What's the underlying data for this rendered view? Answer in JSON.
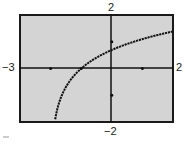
{
  "chart_data": {
    "type": "line",
    "title": "",
    "xlabel": "",
    "ylabel": "",
    "xlim": [
      -3,
      2
    ],
    "ylim": [
      -2,
      2
    ],
    "xtick_labels": {
      "min": "−3",
      "max": "2"
    },
    "ytick_labels": {
      "min": "−2",
      "max": "2"
    },
    "xticks": [
      -2,
      -1,
      1
    ],
    "yticks": [
      -1,
      1
    ],
    "grid": false,
    "legend": null,
    "series": [
      {
        "name": "y = ln(x + 2)",
        "x": [
          -1.85,
          -1.75,
          -1.5,
          -1.25,
          -1,
          -0.5,
          0,
          0.5,
          1,
          1.5,
          2
        ],
        "y": [
          -1.9,
          -1.39,
          -0.69,
          -0.29,
          0,
          0.41,
          0.69,
          0.92,
          1.1,
          1.25,
          1.39
        ]
      }
    ],
    "background_color": "#d4d4d4",
    "curve_color": "#111111"
  },
  "labels": {
    "x_min": "−3",
    "x_max": "2",
    "y_min": "−2",
    "y_max": "2"
  }
}
